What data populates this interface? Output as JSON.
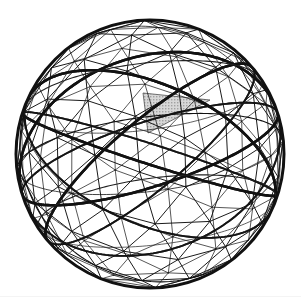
{
  "figure": {
    "type": "geodesic-sphere-diagram",
    "caption": "",
    "background_color": "#ffffff"
  },
  "canvas": {
    "width": 301,
    "height": 303
  },
  "sphere": {
    "center_x": 150,
    "center_y": 154,
    "radius": 134,
    "outline_color": "#111111",
    "outline_width": 3.0,
    "projection": "orthographic",
    "rotation_x_deg": -18,
    "rotation_y_deg": 14,
    "rotation_z_deg": 7
  },
  "mesh": {
    "base_polyhedron": "icosahedron",
    "frequency": 3,
    "vertex_count": 92,
    "face_count": 180,
    "edge_count": 270,
    "show_back_faces": true
  },
  "styles": {
    "great_circle_color": "#111111",
    "great_circle_width": 2.6,
    "chord_color": "#1a1a1a",
    "chord_width": 1.0,
    "chord_width_thin": 0.8,
    "secondary_color": "#222222",
    "shaded_triangle_fill": "#c9c9c9",
    "shaded_triangle_stroke": "#111111",
    "shaded_triangle_opacity": 0.95
  },
  "shaded_triangle": {
    "label": "highlighted spherical triangle",
    "fill_color": "#c9c9c9",
    "vertex_a": [
      143,
      93
    ],
    "vertex_b": [
      210,
      100
    ],
    "vertex_c": [
      148,
      133
    ]
  },
  "great_circles": [
    {
      "name": "equator",
      "tilt_deg": 0,
      "spin_deg": 0,
      "weight": "thin"
    },
    {
      "name": "meridian-primary",
      "tilt_deg": 90,
      "spin_deg": 0,
      "weight": "thin"
    },
    {
      "name": "icosa-band-1",
      "tilt_deg": 58,
      "spin_deg": 0,
      "weight": "thick"
    },
    {
      "name": "icosa-band-2",
      "tilt_deg": 58,
      "spin_deg": 72,
      "weight": "thick"
    },
    {
      "name": "icosa-band-3",
      "tilt_deg": 58,
      "spin_deg": 144,
      "weight": "thick"
    },
    {
      "name": "icosa-band-4",
      "tilt_deg": 58,
      "spin_deg": 216,
      "weight": "thick"
    },
    {
      "name": "icosa-band-5",
      "tilt_deg": 58,
      "spin_deg": 288,
      "weight": "thick"
    },
    {
      "name": "icosa-band-6",
      "tilt_deg": 122,
      "spin_deg": 36,
      "weight": "thick"
    },
    {
      "name": "icosa-band-7",
      "tilt_deg": 122,
      "spin_deg": 108,
      "weight": "thick"
    },
    {
      "name": "icosa-band-8",
      "tilt_deg": 122,
      "spin_deg": 180,
      "weight": "thick"
    },
    {
      "name": "icosa-band-9",
      "tilt_deg": 122,
      "spin_deg": 252,
      "weight": "thick"
    },
    {
      "name": "icosa-band-10",
      "tilt_deg": 122,
      "spin_deg": 324,
      "weight": "thick"
    }
  ],
  "latitude_rings": [
    {
      "name": "upper-ring",
      "latitude_deg": 26.57,
      "weight": "thin"
    },
    {
      "name": "lower-ring",
      "latitude_deg": -26.57,
      "weight": "thin"
    }
  ],
  "scan_artifacts": [
    {
      "name": "bottom-scanline",
      "y": 296
    }
  ],
  "legend": {
    "visible": false,
    "entries": []
  }
}
